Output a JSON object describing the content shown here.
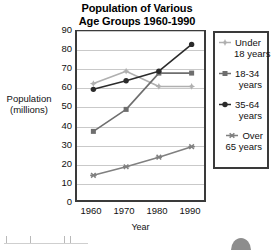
{
  "chart_data": {
    "type": "line",
    "title": "Population of Various Age Groups 1960-1990",
    "title_lines": [
      "Population of Various",
      "Age Groups 1960-1990"
    ],
    "xlabel": "Year",
    "ylabel": "Population (millions)",
    "ylabel_lines": [
      "Population",
      "(millions)"
    ],
    "categories": [
      "1960",
      "1970",
      "1980",
      "1990"
    ],
    "x": [
      1960,
      1970,
      1980,
      1990
    ],
    "xlim": [
      1955,
      1995
    ],
    "ylim": [
      0,
      90
    ],
    "yticks": [
      0,
      10,
      20,
      30,
      40,
      50,
      60,
      70,
      80,
      90
    ],
    "ytick_labels": [
      "0",
      "10",
      "20",
      "30",
      "40",
      "50",
      "60",
      "70",
      "80",
      "90"
    ],
    "grid": true,
    "grid_axis": "y",
    "legend_position": "right-outside",
    "series": [
      {
        "name": "Under 18 years",
        "name_lines": [
          "Under",
          "18 years"
        ],
        "marker": "plus-diamond",
        "color": "#b0b0b0",
        "values": [
          63,
          69.5,
          61.5,
          61.5
        ]
      },
      {
        "name": "18-34 years",
        "name_lines": [
          "18-34",
          "years"
        ],
        "marker": "square",
        "color": "#6e6e6e",
        "values": [
          38,
          49.5,
          68.5,
          68.5
        ]
      },
      {
        "name": "35-64 years",
        "name_lines": [
          "35-64",
          "years"
        ],
        "marker": "circle",
        "color": "#2b2b2b",
        "values": [
          60,
          64.5,
          69.5,
          83.5
        ]
      },
      {
        "name": "Over 65 years",
        "name_lines": [
          "Over",
          "65 years"
        ],
        "marker": "asterisk",
        "color": "#808080",
        "values": [
          15,
          19.5,
          24.5,
          30
        ]
      }
    ]
  },
  "colors": {
    "frame": "#3a3a3a",
    "gridline": "#c9c9c9",
    "background": "#ffffff",
    "text": "#111111"
  }
}
